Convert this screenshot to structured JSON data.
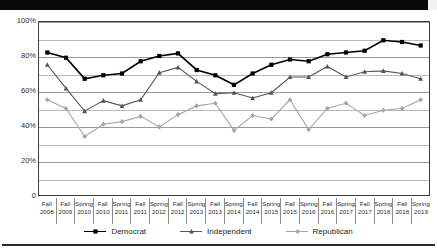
{
  "chart_data": {
    "type": "line",
    "title": "",
    "xlabel": "",
    "ylabel": "",
    "ylim": [
      0,
      100
    ],
    "ytick_labels": [
      "100%",
      "80%",
      "60%",
      "40%",
      "20%",
      "0"
    ],
    "ytick_values": [
      100,
      80,
      60,
      40,
      20,
      0
    ],
    "grid": true,
    "grid_interval": 10,
    "legend_position": "bottom",
    "categories": [
      "Fall 2008",
      "Fall 2009",
      "Spring 2010",
      "Fall 2010",
      "Spring 2011",
      "Fall 2011",
      "Spring 2012",
      "Fall 2012",
      "Spring 2013",
      "Fall 2013",
      "Spring 2014",
      "Fall 2014",
      "Spring 2015",
      "Fall 2015",
      "Spring 2016",
      "Fall 2016",
      "Spring 2017",
      "Fall 2017",
      "Spring 2018",
      "Fall 2018",
      "Spring 2019"
    ],
    "category_parts": [
      {
        "season": "Fall",
        "year": "2008"
      },
      {
        "season": "Fall",
        "year": "2009"
      },
      {
        "season": "Spring",
        "year": "2010"
      },
      {
        "season": "Fall",
        "year": "2010"
      },
      {
        "season": "Spring",
        "year": "2011"
      },
      {
        "season": "Fall",
        "year": "2011"
      },
      {
        "season": "Spring",
        "year": "2012"
      },
      {
        "season": "Fall",
        "year": "2012"
      },
      {
        "season": "Spring",
        "year": "2013"
      },
      {
        "season": "Fall",
        "year": "2013"
      },
      {
        "season": "Spring",
        "year": "2014"
      },
      {
        "season": "Fall",
        "year": "2014"
      },
      {
        "season": "Spring",
        "year": "2015"
      },
      {
        "season": "Fall",
        "year": "2015"
      },
      {
        "season": "Spring",
        "year": "2016"
      },
      {
        "season": "Fall",
        "year": "2016"
      },
      {
        "season": "Spring",
        "year": "2017"
      },
      {
        "season": "Fall",
        "year": "2017"
      },
      {
        "season": "Spring",
        "year": "2018"
      },
      {
        "season": "Fall",
        "year": "2018"
      },
      {
        "season": "Spring",
        "year": "2019"
      }
    ],
    "series": [
      {
        "name": "Democrat",
        "color": "#000000",
        "marker": "square",
        "values": [
          82,
          79,
          67,
          69,
          70,
          77,
          80,
          81.5,
          72,
          69,
          63.5,
          70,
          75,
          78,
          77,
          81,
          82,
          83,
          89,
          88,
          86
        ]
      },
      {
        "name": "Independent",
        "color": "#555555",
        "marker": "triangle",
        "values": [
          75,
          61.5,
          48.5,
          54.5,
          51.5,
          55,
          70.5,
          73.5,
          65.5,
          58.5,
          59,
          56,
          59,
          68,
          68,
          74,
          68,
          71,
          71.5,
          70,
          67
        ]
      },
      {
        "name": "Republican",
        "color": "#a6a6a6",
        "marker": "diamond",
        "values": [
          55,
          50,
          34,
          41,
          42.5,
          45.5,
          39.5,
          46.5,
          51.5,
          53,
          37.5,
          46,
          44,
          55,
          38,
          50,
          53,
          46,
          49,
          50,
          55
        ]
      }
    ]
  },
  "legend": {
    "items": [
      {
        "label": "Democrat"
      },
      {
        "label": "Independent"
      },
      {
        "label": "Republican"
      }
    ]
  }
}
